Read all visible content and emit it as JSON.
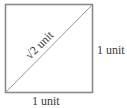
{
  "diagram": {
    "type": "square-with-diagonal",
    "stroke_color": "#8a8a8a",
    "text_color": "#3a3a3a",
    "labels": {
      "diagonal": {
        "radical": "√",
        "value": "2 unit"
      },
      "right_side": "1 unit",
      "bottom_side": "1 unit"
    }
  }
}
